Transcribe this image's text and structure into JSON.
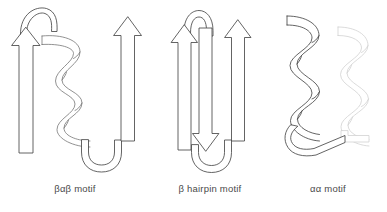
{
  "figure": {
    "title_text": "",
    "background_color": "#ffffff",
    "line_color": "#3c3c3c",
    "faded_line_color": "#cfcfcf",
    "label_color": "#4a4a4a"
  },
  "panels": [
    {
      "id": "bab",
      "label": "βαβ motif",
      "elements": [
        {
          "name": "beta-strand-arrow-left",
          "type": "arrow",
          "direction": "up"
        },
        {
          "name": "loop-top",
          "type": "loop"
        },
        {
          "name": "alpha-helix-ribbon",
          "type": "helix"
        },
        {
          "name": "loop-bottom",
          "type": "loop"
        },
        {
          "name": "beta-strand-arrow-right",
          "type": "arrow",
          "direction": "up"
        }
      ]
    },
    {
      "id": "hairpin",
      "label": "β hairpin motif",
      "elements": [
        {
          "name": "beta-strand-arrow-left",
          "type": "arrow",
          "direction": "up"
        },
        {
          "name": "loop-top",
          "type": "loop"
        },
        {
          "name": "beta-strand-arrow-middle",
          "type": "arrow",
          "direction": "down"
        },
        {
          "name": "loop-bottom",
          "type": "loop"
        },
        {
          "name": "beta-strand-arrow-right",
          "type": "arrow",
          "direction": "up"
        }
      ]
    },
    {
      "id": "aa",
      "label": "αα motif",
      "elements": [
        {
          "name": "alpha-helix-ribbon-front",
          "type": "helix"
        },
        {
          "name": "loop-bottom",
          "type": "loop"
        },
        {
          "name": "alpha-helix-ribbon-back",
          "type": "helix"
        }
      ]
    }
  ]
}
